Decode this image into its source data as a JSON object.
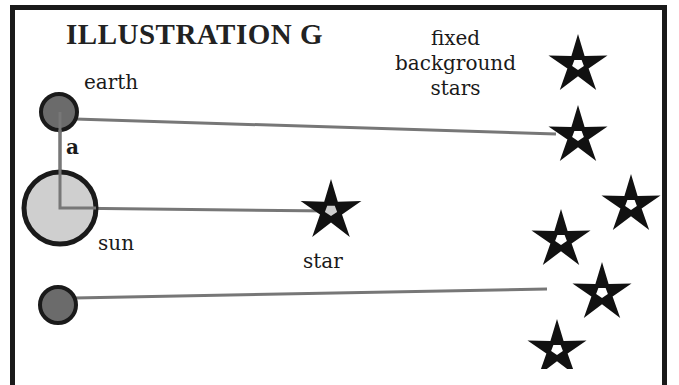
{
  "title": "ILLUSTRATION G",
  "labels": {
    "earth": "earth",
    "angle": "a",
    "sun": "sun",
    "star": "star",
    "background": [
      "fixed",
      "background",
      "stars"
    ]
  },
  "colors": {
    "frame": "#1a1a1a",
    "earth_fill": "#6b6b6b",
    "sun_fill": "#cfcfcf",
    "outline": "#1a1a1a",
    "sight_line": "#777777",
    "star_fill": "#111111"
  },
  "bodies": {
    "earth_top": {
      "cx": 59,
      "cy": 112,
      "r": 18
    },
    "sun": {
      "cx": 60,
      "cy": 208,
      "r": 36
    },
    "earth_bottom": {
      "cx": 58,
      "cy": 305,
      "r": 18
    }
  },
  "near_star": {
    "cx": 331,
    "cy": 211,
    "r": 32
  },
  "sight_lines": [
    {
      "from": [
        75,
        119
      ],
      "to": [
        556,
        134
      ]
    },
    {
      "from": [
        60,
        208
      ],
      "to": [
        331,
        211
      ]
    },
    {
      "from": [
        74,
        298
      ],
      "to": [
        547,
        289
      ]
    },
    {
      "from": [
        60,
        120
      ],
      "to": [
        60,
        208
      ]
    }
  ],
  "background_stars": [
    {
      "cx": 578,
      "cy": 65,
      "r": 31
    },
    {
      "cx": 578,
      "cy": 136,
      "r": 31
    },
    {
      "cx": 631,
      "cy": 205,
      "r": 31
    },
    {
      "cx": 561,
      "cy": 240,
      "r": 31
    },
    {
      "cx": 602,
      "cy": 293,
      "r": 31
    },
    {
      "cx": 557,
      "cy": 350,
      "r": 31
    }
  ]
}
